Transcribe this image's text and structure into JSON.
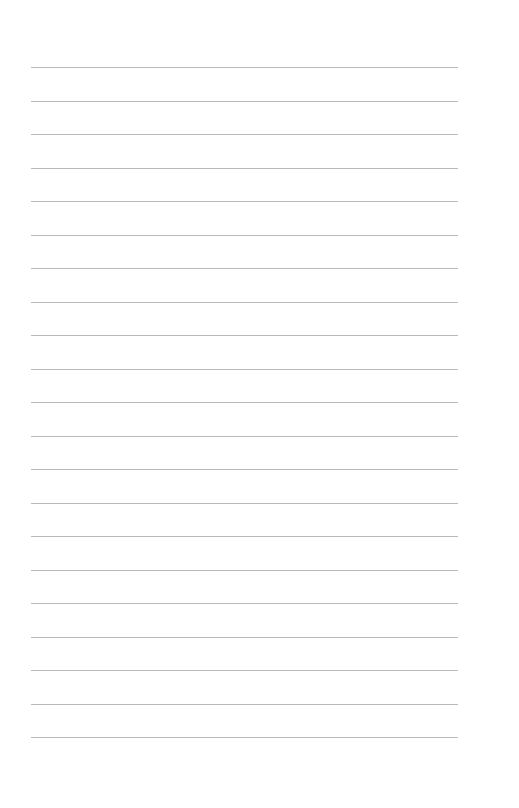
{
  "page": {
    "type": "blank-lined-paper",
    "background_color": "#ffffff",
    "rule_color": "#b9b9b9",
    "rule_count": 21,
    "rule_left_px": 31,
    "rule_right_px": 458,
    "first_rule_y_px": 67,
    "rule_spacing_px": 33.5,
    "lines": [
      {
        "text": ""
      },
      {
        "text": ""
      },
      {
        "text": ""
      },
      {
        "text": ""
      },
      {
        "text": ""
      },
      {
        "text": ""
      },
      {
        "text": ""
      },
      {
        "text": ""
      },
      {
        "text": ""
      },
      {
        "text": ""
      },
      {
        "text": ""
      },
      {
        "text": ""
      },
      {
        "text": ""
      },
      {
        "text": ""
      },
      {
        "text": ""
      },
      {
        "text": ""
      },
      {
        "text": ""
      },
      {
        "text": ""
      },
      {
        "text": ""
      },
      {
        "text": ""
      },
      {
        "text": ""
      }
    ]
  }
}
